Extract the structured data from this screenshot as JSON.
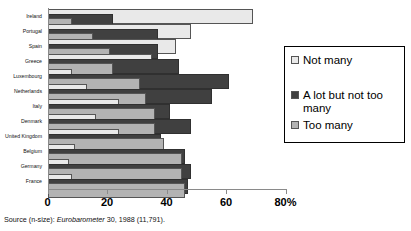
{
  "chart_data": {
    "type": "bar",
    "orientation": "horizontal",
    "title": "",
    "xlabel": "",
    "ylabel": "",
    "xlim": [
      0,
      80
    ],
    "xticks": [
      0,
      20,
      40,
      60,
      80
    ],
    "xtick_labels": [
      "0",
      "20",
      "40",
      "60",
      "80%"
    ],
    "grid": false,
    "legend_position": "right",
    "categories": [
      "Ireland",
      "Portugal",
      "Spain",
      "Greece",
      "Luxembourg",
      "Netherlands",
      "Italy",
      "Denmark",
      "United Kingdom",
      "Belgium",
      "Germany",
      "France"
    ],
    "series": [
      {
        "name": "Not many",
        "color": "#e9e9e9",
        "values": [
          69,
          48,
          43,
          35,
          8,
          13,
          24,
          16,
          24,
          9,
          7,
          8
        ]
      },
      {
        "name": "A lot but not too many",
        "color": "#404040",
        "values": [
          22,
          37,
          37,
          44,
          61,
          55,
          41,
          48,
          38,
          46,
          48,
          47
        ]
      },
      {
        "name": "Too many",
        "color": "#b3b3b3",
        "values": [
          8,
          15,
          21,
          22,
          31,
          33,
          36,
          36,
          39,
          45,
          45,
          46
        ]
      }
    ],
    "source_note_prefix": "Source (n-size): ",
    "source_note_italic": "Eurobarometer",
    "source_note_suffix": " 30, 1988 (11,791)."
  },
  "legend": {
    "items": [
      {
        "label": "Not many"
      },
      {
        "label": "A lot but not too many"
      },
      {
        "label": "Too many"
      }
    ]
  }
}
